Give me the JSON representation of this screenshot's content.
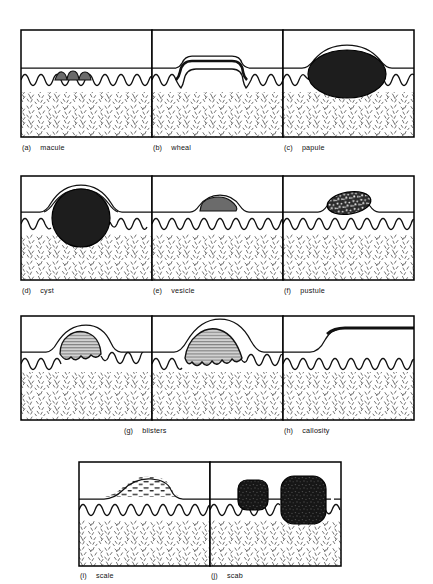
{
  "figure": {
    "rows": [
      {
        "row_id": "row-1",
        "panels": [
          {
            "key": "(a)",
            "label": "macule",
            "lesion": "macule",
            "description": "flat pigmented patch confined to the epidermis, no surface elevation"
          },
          {
            "key": "(b)",
            "label": "wheal",
            "lesion": "wheal",
            "description": "flat-topped plateau elevation of the surface with dermal oedema"
          },
          {
            "key": "(c)",
            "label": "papule",
            "lesion": "papule",
            "description": "large solid dark mass raising the skin surface into a dome"
          }
        ]
      },
      {
        "row_id": "row-2",
        "panels": [
          {
            "key": "(d)",
            "label": "cyst",
            "lesion": "cyst",
            "description": "deep round sac extending into the dermis, double-arc surface elevation"
          },
          {
            "key": "(e)",
            "label": "vesicle",
            "lesion": "vesicle",
            "description": "small grey fluid blob within the epidermis, gentle bump"
          },
          {
            "key": "(f)",
            "label": "pustule",
            "lesion": "pustule",
            "description": "speckled pus-filled oval within the epidermis"
          }
        ]
      },
      {
        "row_id": "row-3",
        "panels": [
          {
            "key": "(g)",
            "label": "blisters",
            "lesion": "blister-small",
            "description": "dome-shaped hatched fluid cavity with scalloped base"
          },
          {
            "key": "",
            "label": "",
            "lesion": "blister-large",
            "description": "taller broader hatched fluid dome extending below the junction"
          },
          {
            "key": "(h)",
            "label": "callosity",
            "lesion": "callosity",
            "description": "step-up thickening of the stratum corneum forming a raised plateau"
          }
        ]
      },
      {
        "row_id": "row-4",
        "panels": [
          {
            "key": "(i)",
            "label": "scale",
            "lesion": "scale",
            "description": "heaped dash-like flakes of keratin above the surface"
          },
          {
            "key": "(j)",
            "label": "scab",
            "lesion": "scab",
            "description": "two dark crust masses, the larger penetrating into the dermis"
          }
        ]
      }
    ],
    "layers": [
      {
        "name": "stratum corneum / surface",
        "fill": "#ffffff"
      },
      {
        "name": "epidermis",
        "fill": "#ffffff"
      },
      {
        "name": "dermis",
        "fill": "stipple"
      }
    ],
    "colors": {
      "ink": "#111111",
      "frame": "#000000",
      "lesion_dark": "#1a1a1a",
      "lesion_mid": "#6e6e6e",
      "lesion_hatch": "#b9b9b9",
      "dermis_stipple": "#5a5a5a",
      "background": "#ffffff"
    }
  }
}
